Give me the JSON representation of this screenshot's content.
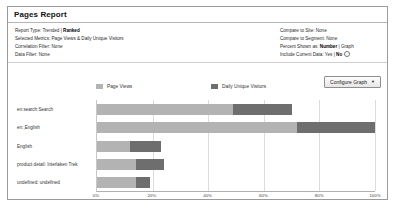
{
  "window": {
    "title": "Pages Report"
  },
  "meta": {
    "left": [
      {
        "label": "Report Type:",
        "value": "Trended | ",
        "bold": "Ranked"
      },
      {
        "label": "Selected Metrics:",
        "value": "Page Views & Daily Unique Visitors",
        "bold": ""
      },
      {
        "label": "Correlation Filter:",
        "value": "None",
        "bold": ""
      },
      {
        "label": "Data Filter:",
        "value": "None",
        "bold": ""
      }
    ],
    "right": [
      {
        "label": "Compare to Site:",
        "value": "None",
        "bold": ""
      },
      {
        "label": "Compare to Segment:",
        "value": "None",
        "bold": ""
      },
      {
        "label": "Percent Shown as:",
        "value": " | Graph",
        "bold": "Number"
      },
      {
        "label": "Include Current Data:",
        "value": "Yes | ",
        "bold": "No"
      }
    ]
  },
  "toolbar": {
    "configure_label": "Configure Graph",
    "caret": "▼"
  },
  "colors": {
    "page_views": "#b3b3b3",
    "daily_unique_visitors": "#6e6e6e",
    "panel_border": "#9a9a9a",
    "grid": "#dcdcdc"
  },
  "chart_data": {
    "type": "bar",
    "orientation": "horizontal",
    "stacked": true,
    "title": "",
    "xlabel": "",
    "ylabel": "",
    "xlim": [
      0,
      100
    ],
    "grid": true,
    "legend_position": "top",
    "categories": [
      "en:search:Search",
      "en:,English",
      "English",
      "product detail: Interlaken Trek",
      "undefined: undefined"
    ],
    "tick_labels": [
      "0%",
      "20%",
      "40%",
      "60%",
      "80%",
      "100%"
    ],
    "ticks": [
      0,
      20,
      40,
      60,
      80,
      100
    ],
    "series": [
      {
        "name": "Page Views",
        "values": [
          49,
          72,
          12,
          14,
          14
        ]
      },
      {
        "name": "Daily Unique Visitors",
        "values": [
          21,
          28,
          11,
          10,
          5
        ]
      }
    ]
  }
}
